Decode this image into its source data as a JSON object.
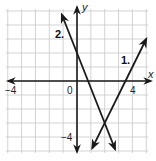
{
  "chart_data": {
    "type": "line",
    "title": "",
    "xlabel": "x",
    "ylabel": "y",
    "xlim": [
      -5,
      5
    ],
    "ylim": [
      -5,
      5
    ],
    "grid": true,
    "grid_step": 1,
    "tick_labels": {
      "x": [
        {
          "value": -4,
          "label": "−4"
        },
        {
          "value": 0,
          "label": "0"
        },
        {
          "value": 4,
          "label": "4"
        }
      ],
      "y": [
        {
          "value": -4,
          "label": "−4"
        }
      ]
    },
    "series": [
      {
        "name": "1.",
        "equation": "y = 2x - 7",
        "slope": 2,
        "intercept": -7,
        "x": [
          1.1,
          5.0
        ],
        "y": [
          -4.8,
          3.0
        ],
        "arrows": "both",
        "label_pos": [
          4.0,
          2.0
        ]
      },
      {
        "name": "2.",
        "equation": "y = -2.5x + 2",
        "slope": -2.5,
        "intercept": 2,
        "x": [
          -1.1,
          2.75
        ],
        "y": [
          4.75,
          -4.875
        ],
        "arrows": "both",
        "label_pos": [
          -2.0,
          4.2
        ]
      }
    ],
    "intersection": {
      "x": 2,
      "y": -3
    },
    "axes_arrows": true
  },
  "labels": {
    "x_axis": "x",
    "y_axis": "y",
    "line1": "1.",
    "line2": "2.",
    "tick_neg4_x": "−4",
    "tick_zero": "0",
    "tick_4_x": "4",
    "tick_neg4_y": "−4"
  }
}
